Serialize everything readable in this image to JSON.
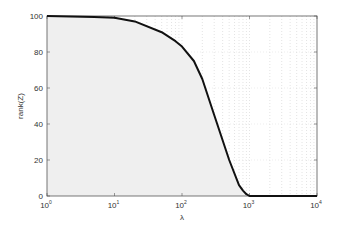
{
  "chart_data": {
    "type": "area",
    "title": "",
    "xlabel": "λ",
    "ylabel": "rank(Z)",
    "xscale": "log",
    "xlim": [
      1,
      10000
    ],
    "ylim": [
      0,
      100
    ],
    "x_ticks": [
      {
        "value": 1,
        "base": "10",
        "exp": "0"
      },
      {
        "value": 10,
        "base": "10",
        "exp": "1"
      },
      {
        "value": 100,
        "base": "10",
        "exp": "2"
      },
      {
        "value": 1000,
        "base": "10",
        "exp": "3"
      },
      {
        "value": 10000,
        "base": "10",
        "exp": "4"
      }
    ],
    "y_ticks": [
      0,
      20,
      40,
      60,
      80,
      100
    ],
    "grid": "dotted minor grid (log x)",
    "legend": null,
    "series": [
      {
        "name": "rank(Z)",
        "x": [
          1,
          5,
          10,
          20,
          50,
          80,
          100,
          150,
          200,
          300,
          500,
          700,
          800,
          900,
          1000,
          2000,
          5000,
          10000
        ],
        "values": [
          100,
          99.5,
          99,
          97,
          91,
          86,
          83,
          75,
          65,
          45,
          20,
          6,
          3,
          1,
          0,
          0,
          0,
          0
        ],
        "fill": "#efefef",
        "line_color": "#111111"
      }
    ]
  }
}
